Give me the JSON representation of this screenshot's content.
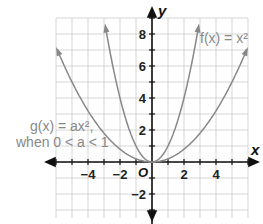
{
  "chart_data": {
    "type": "line",
    "title": "",
    "xlabel": "x",
    "ylabel": "y",
    "origin_label": "O",
    "xlim": [
      -6,
      6
    ],
    "ylim": [
      -3.5,
      9
    ],
    "grid": true,
    "x_ticks": [
      -4,
      -2,
      2,
      4
    ],
    "y_ticks": [
      8,
      6,
      4,
      2,
      -2
    ],
    "x_tick_labels": [
      "−4",
      "−2",
      "2",
      "4"
    ],
    "y_tick_labels": [
      "8",
      "6",
      "4",
      "2",
      "−2"
    ],
    "series": [
      {
        "name": "f(x) = x²",
        "formula": "x^2",
        "x": [
          -3,
          -2,
          -1,
          0,
          1,
          2,
          3
        ],
        "values": [
          9,
          4,
          1,
          0,
          1,
          4,
          9
        ]
      },
      {
        "name": "g(x) = ax², when 0 < a < 1",
        "formula": "0.2x^2",
        "x": [
          -6,
          -4,
          -2,
          0,
          2,
          4,
          6
        ],
        "values": [
          7.2,
          3.2,
          0.8,
          0,
          0.8,
          3.2,
          7.2
        ]
      }
    ],
    "annotations": [
      "f(x) = x²",
      "g(x) = ax²,",
      "when 0 < a < 1"
    ]
  },
  "labels": {
    "f": "f(x) = x²",
    "g1": "g(x) = ax²,",
    "g2": "when 0 < a < 1",
    "x": "x",
    "y": "y",
    "o": "O"
  }
}
